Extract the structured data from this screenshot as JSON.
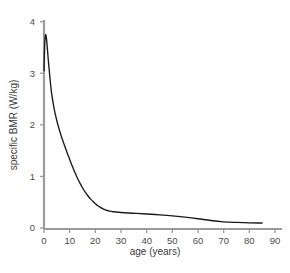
{
  "figure": {
    "name": "specific-bmr-vs-age-plot",
    "background_color": "#ffffff",
    "axis_color": "#9b9b9b",
    "curve_color": "#1a1a1a",
    "label_color": "#4a4a4a"
  },
  "chart_data": {
    "type": "line",
    "title": "",
    "xlabel": "age (years)",
    "ylabel": "specific BMR (W/kg)",
    "xlim": [
      0,
      92
    ],
    "ylim": [
      0,
      4.2
    ],
    "xticks": [
      0,
      10,
      20,
      30,
      40,
      50,
      60,
      70,
      80,
      90
    ],
    "xtick_labels": [
      "0",
      "10",
      "20",
      "30",
      "40",
      "50",
      "60",
      "70",
      "80",
      "90"
    ],
    "yticks": [
      0,
      1,
      2,
      3,
      4
    ],
    "ytick_labels": [
      "0",
      "1",
      "2",
      "3",
      "4"
    ],
    "grid": false,
    "legend": null,
    "series": [
      {
        "name": "specific BMR",
        "color": "#1a1a1a",
        "x": [
          0,
          0.15,
          0.3,
          0.5,
          0.7,
          0.9,
          1.2,
          1.6,
          2,
          2.5,
          3,
          4,
          5,
          6,
          7,
          8,
          9,
          10,
          11,
          12,
          13,
          14,
          15,
          16,
          17,
          18,
          19,
          20,
          21,
          22,
          23,
          24,
          25,
          27,
          30,
          33,
          36,
          40,
          45,
          50,
          55,
          60,
          65,
          70,
          75,
          80,
          85
        ],
        "y": [
          3.05,
          3.35,
          3.58,
          3.72,
          3.75,
          3.7,
          3.55,
          3.3,
          3.08,
          2.82,
          2.6,
          2.3,
          2.08,
          1.9,
          1.74,
          1.6,
          1.46,
          1.33,
          1.2,
          1.08,
          0.97,
          0.87,
          0.78,
          0.7,
          0.63,
          0.57,
          0.52,
          0.47,
          0.43,
          0.4,
          0.37,
          0.35,
          0.335,
          0.315,
          0.3,
          0.29,
          0.283,
          0.272,
          0.255,
          0.235,
          0.21,
          0.18,
          0.145,
          0.12,
          0.108,
          0.1,
          0.097
        ]
      }
    ]
  }
}
